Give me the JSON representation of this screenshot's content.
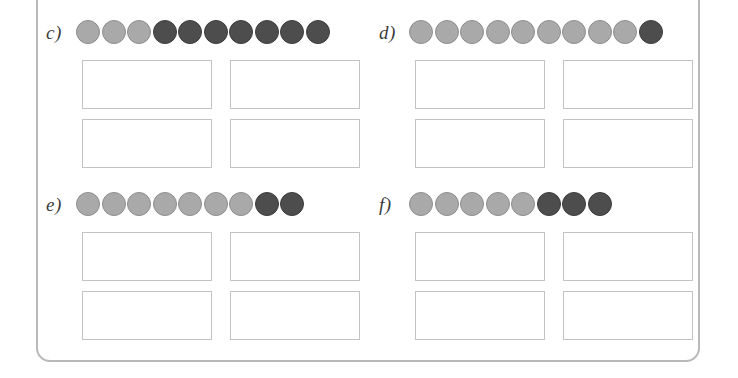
{
  "worksheet": {
    "frame_color": "#b9b9b9",
    "background": "#ffffff",
    "token_light_color": "#a9a9a9",
    "token_dark_color": "#4d4d4d",
    "exercises": [
      {
        "id": "c",
        "label": "c)",
        "tokens": [
          "light",
          "light",
          "light",
          "dark",
          "dark",
          "dark",
          "dark",
          "dark",
          "dark",
          "dark"
        ],
        "total_count": 10,
        "light_count": 3,
        "dark_count": 7,
        "answer_boxes": [
          {
            "value": ""
          },
          {
            "value": ""
          },
          {
            "value": ""
          },
          {
            "value": ""
          }
        ]
      },
      {
        "id": "d",
        "label": "d)",
        "tokens": [
          "light",
          "light",
          "light",
          "light",
          "light",
          "light",
          "light",
          "light",
          "light",
          "dark"
        ],
        "total_count": 10,
        "light_count": 9,
        "dark_count": 1,
        "answer_boxes": [
          {
            "value": ""
          },
          {
            "value": ""
          },
          {
            "value": ""
          },
          {
            "value": ""
          }
        ]
      },
      {
        "id": "e",
        "label": "e)",
        "tokens": [
          "light",
          "light",
          "light",
          "light",
          "light",
          "light",
          "light",
          "dark",
          "dark"
        ],
        "total_count": 9,
        "light_count": 7,
        "dark_count": 2,
        "answer_boxes": [
          {
            "value": ""
          },
          {
            "value": ""
          },
          {
            "value": ""
          },
          {
            "value": ""
          }
        ]
      },
      {
        "id": "f",
        "label": "f)",
        "tokens": [
          "light",
          "light",
          "light",
          "light",
          "light",
          "dark",
          "dark",
          "dark"
        ],
        "total_count": 8,
        "light_count": 5,
        "dark_count": 3,
        "answer_boxes": [
          {
            "value": ""
          },
          {
            "value": ""
          },
          {
            "value": ""
          },
          {
            "value": ""
          }
        ]
      }
    ]
  }
}
